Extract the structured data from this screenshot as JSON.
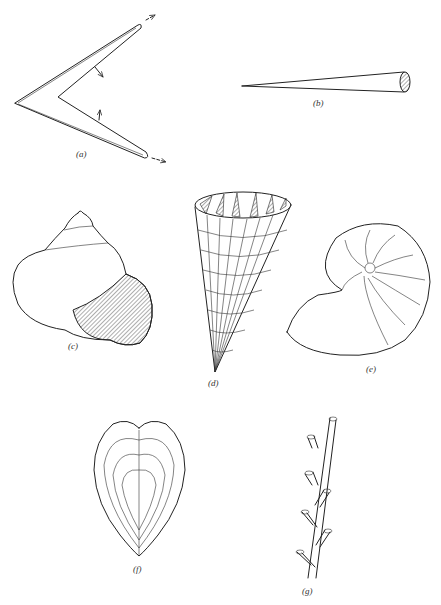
{
  "figure": {
    "panels": [
      {
        "id": "a",
        "label": "(a)",
        "subject": "chevron / bent growth form with arrows indicating growth directions"
      },
      {
        "id": "b",
        "label": "(b)",
        "subject": "elongated tapering cone (tusk-like) with hatched cross-section"
      },
      {
        "id": "c",
        "label": "(c)",
        "subject": "turbinate gastropod shell with hatched aperture"
      },
      {
        "id": "d",
        "label": "(d)",
        "subject": "conical gridded shell with hatched septa at opening"
      },
      {
        "id": "e",
        "label": "(e)",
        "subject": "coiled nautilus-like shell with chambers"
      },
      {
        "id": "f",
        "label": "(f)",
        "subject": "heart-shaped bivalve with growth lines"
      },
      {
        "id": "g",
        "label": "(g)",
        "subject": "branching tubular colony"
      }
    ]
  },
  "colors": {
    "ink": "#222222",
    "paper": "#ffffff"
  }
}
